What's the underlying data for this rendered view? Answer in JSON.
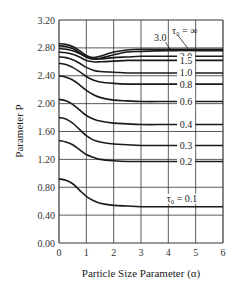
{
  "chart_data": {
    "type": "line",
    "title": "",
    "xlabel": "Particle Size Parameter (α)",
    "ylabel": "Parameter P",
    "xlim": [
      0,
      6
    ],
    "ylim": [
      0,
      3.2
    ],
    "x_ticks": [
      "0",
      "1",
      "2",
      "3",
      "4",
      "5",
      "6"
    ],
    "y_ticks": [
      "0.00",
      "0.40",
      "0.80",
      "1.20",
      "1.60",
      "2.00",
      "2.40",
      "2.80",
      "3.20"
    ],
    "grid": true,
    "legend": "inline labels at right",
    "x": [
      0,
      0.25,
      0.5,
      0.75,
      1.0,
      1.25,
      1.5,
      2.0,
      2.5,
      3.0,
      4.0,
      5.0,
      6.0
    ],
    "series": [
      {
        "name": "τ₀ = ∞",
        "label": "τ₀ = ∞",
        "values": [
          2.86,
          2.85,
          2.82,
          2.76,
          2.69,
          2.66,
          2.68,
          2.74,
          2.77,
          2.78,
          2.78,
          2.78,
          2.78
        ]
      },
      {
        "name": "3.0",
        "label": "3.0",
        "values": [
          2.83,
          2.82,
          2.79,
          2.73,
          2.67,
          2.64,
          2.65,
          2.7,
          2.74,
          2.75,
          2.76,
          2.76,
          2.76
        ]
      },
      {
        "name": "2.0",
        "label": "2.0",
        "values": [
          2.79,
          2.78,
          2.76,
          2.72,
          2.67,
          2.64,
          2.64,
          2.66,
          2.67,
          2.68,
          2.68,
          2.68,
          2.68
        ]
      },
      {
        "name": "1.5",
        "label": "1.5",
        "values": [
          2.74,
          2.73,
          2.71,
          2.67,
          2.62,
          2.6,
          2.6,
          2.61,
          2.62,
          2.62,
          2.62,
          2.62,
          2.62
        ]
      },
      {
        "name": "1.0",
        "label": "1.0",
        "values": [
          2.67,
          2.66,
          2.63,
          2.58,
          2.52,
          2.48,
          2.46,
          2.45,
          2.44,
          2.44,
          2.44,
          2.44,
          2.44
        ]
      },
      {
        "name": "0.8",
        "label": "0.8",
        "values": [
          2.58,
          2.56,
          2.52,
          2.46,
          2.39,
          2.34,
          2.31,
          2.29,
          2.28,
          2.28,
          2.28,
          2.28,
          2.28
        ]
      },
      {
        "name": "0.6",
        "label": "0.6",
        "values": [
          2.4,
          2.38,
          2.34,
          2.27,
          2.19,
          2.13,
          2.09,
          2.05,
          2.04,
          2.03,
          2.03,
          2.03,
          2.03
        ]
      },
      {
        "name": "0.4",
        "label": "0.4",
        "values": [
          2.06,
          2.04,
          1.99,
          1.91,
          1.83,
          1.78,
          1.75,
          1.72,
          1.71,
          1.7,
          1.7,
          1.7,
          1.7
        ]
      },
      {
        "name": "0.3",
        "label": "0.3",
        "values": [
          1.8,
          1.78,
          1.72,
          1.63,
          1.54,
          1.48,
          1.45,
          1.42,
          1.41,
          1.4,
          1.4,
          1.4,
          1.4
        ]
      },
      {
        "name": "0.2",
        "label": "0.2",
        "values": [
          1.47,
          1.45,
          1.41,
          1.34,
          1.27,
          1.23,
          1.2,
          1.18,
          1.17,
          1.17,
          1.17,
          1.17,
          1.17
        ]
      },
      {
        "name": "τ₀ = 0.1",
        "label": "τ₀ = 0.1",
        "values": [
          0.92,
          0.9,
          0.85,
          0.76,
          0.67,
          0.61,
          0.57,
          0.54,
          0.53,
          0.52,
          0.52,
          0.52,
          0.52
        ]
      }
    ],
    "annotations": [
      {
        "text": "τ₀ = ∞",
        "x": 4.6,
        "y": 3.0
      },
      {
        "text": "3.0",
        "x": 3.7,
        "y": 2.9
      }
    ]
  },
  "style": {
    "line_color": "#1a1a1a",
    "grid_color": "#333333",
    "background": "#ffffff"
  }
}
